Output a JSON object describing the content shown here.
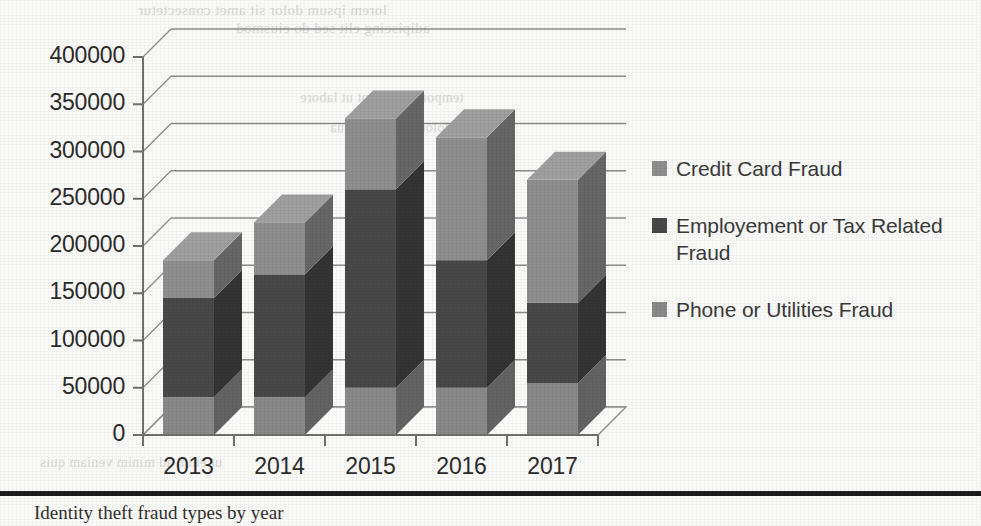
{
  "chart_data": {
    "type": "bar",
    "subtype": "stacked-3d-column",
    "title": "",
    "xlabel": "",
    "ylabel": "",
    "categories": [
      "2013",
      "2014",
      "2015",
      "2016",
      "2017"
    ],
    "ylim": [
      0,
      400000
    ],
    "ytick_values": [
      0,
      50000,
      100000,
      150000,
      200000,
      250000,
      300000,
      350000,
      400000
    ],
    "ytick_labels": [
      "0",
      "50000",
      "100000",
      "150000",
      "200000",
      "250000",
      "300000",
      "350000",
      "400000"
    ],
    "grid": true,
    "grid_axis": "y",
    "legend_position": "right",
    "stack_order_bottom_to_top": [
      "Phone or Utilities Fraud",
      "Employement or Tax Related Fraud",
      "Credit Card Fraud"
    ],
    "series": [
      {
        "name": "Credit Card Fraud",
        "color": "#8f8f8f",
        "values": [
          40000,
          55000,
          75000,
          130000,
          130000
        ]
      },
      {
        "name": "Employement or Tax Related Fraud",
        "color": "#484848",
        "values": [
          105000,
          130000,
          210000,
          135000,
          85000
        ]
      },
      {
        "name": "Phone or Utilities Fraud",
        "color": "#8a8a8a",
        "values": [
          40000,
          40000,
          50000,
          50000,
          55000
        ]
      }
    ],
    "totals": [
      185000,
      225000,
      335000,
      315000,
      270000
    ]
  },
  "axis": {
    "y_labels": [
      "400000",
      "350000",
      "300000",
      "250000",
      "200000",
      "150000",
      "100000",
      "50000",
      "0"
    ],
    "x_labels": [
      "2013",
      "2014",
      "2015",
      "2016",
      "2017"
    ]
  },
  "legend": {
    "items": [
      {
        "label": "Credit Card Fraud",
        "color": "#8f8f8f"
      },
      {
        "label": "Employement or Tax Related Fraud",
        "color": "#484848"
      },
      {
        "label": "Phone or Utilities Fraud",
        "color": "#8a8a8a"
      }
    ]
  },
  "page": {
    "bleed_text": {
      "a": "lorem ipsum dolor sit amet consectetur",
      "b": "adipiscing elit sed do eiusmod",
      "c": "tempor incididunt ut labore",
      "d": "et dolore magna aliqua",
      "e": "ut enim ad minim veniam quis"
    },
    "footer_text": "Identity theft fraud types by year"
  }
}
